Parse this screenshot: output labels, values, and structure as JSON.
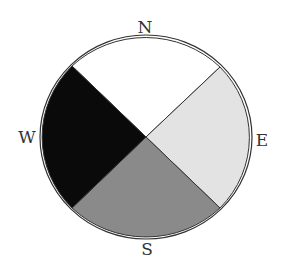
{
  "diagram": {
    "type": "compass-quadrant-pie",
    "labels": {
      "north": "N",
      "east": "E",
      "south": "S",
      "west": "W"
    },
    "sectors": [
      {
        "name": "north",
        "color": "#ffffff"
      },
      {
        "name": "east",
        "color": "#e3e3e3"
      },
      {
        "name": "south",
        "color": "#8a8a8a"
      },
      {
        "name": "west",
        "color": "#0a0a0a"
      }
    ],
    "outline_color": "#333333"
  }
}
